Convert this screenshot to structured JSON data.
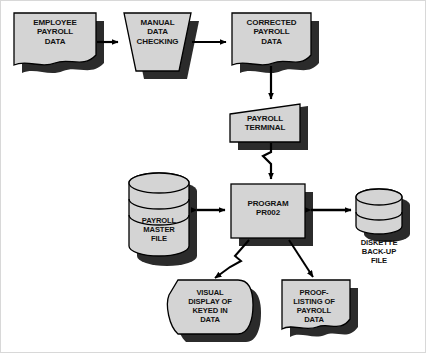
{
  "diagram": {
    "style": {
      "fill": "#d4d4d4",
      "shadow": "#2b2b2b",
      "stroke": "#000000",
      "background": "#ffffff",
      "frame": "#d8d8d8"
    },
    "nodes": [
      {
        "id": "employee-payroll-data",
        "name": "employee-payroll-data",
        "shape": "document",
        "label": "EMPLOYEE\nPAYROLL\nDATA",
        "x": 13,
        "y": 12,
        "w": 82,
        "h": 58
      },
      {
        "id": "manual-data-checking",
        "name": "manual-data-checking",
        "shape": "manual-operation-trapezoid",
        "label": "MANUAL\nDATA\nCHECKING",
        "x": 123,
        "y": 12,
        "w": 67,
        "h": 58
      },
      {
        "id": "corrected-payroll-data",
        "name": "corrected-payroll-data",
        "shape": "document",
        "label": "CORRECTED\nPAYROLL\nDATA",
        "x": 231,
        "y": 12,
        "w": 79,
        "h": 58
      },
      {
        "id": "payroll-terminal",
        "name": "payroll-terminal",
        "shape": "manual-input",
        "label": "PAYROLL\nTERMINAL",
        "x": 229,
        "y": 103,
        "w": 70,
        "h": 38
      },
      {
        "id": "program-pr002",
        "name": "program-pr002",
        "shape": "process-rectangle",
        "label": "PROGRAM\nPR002",
        "x": 230,
        "y": 183,
        "w": 74,
        "h": 54
      },
      {
        "id": "payroll-master-file",
        "name": "payroll-master-file",
        "shape": "disk-cylinder",
        "label": "PAYROLL\nMASTER\nFILE",
        "x": 128,
        "y": 172,
        "w": 60,
        "h": 83
      },
      {
        "id": "diskette-back-up-file",
        "name": "diskette-back-up-file",
        "shape": "disk-cylinder",
        "label": "DISKETTE\nBACK-UP\nFILE",
        "x": 355,
        "y": 188,
        "w": 46,
        "h": 45,
        "label_position": "below"
      },
      {
        "id": "visual-display-of-keyed-in-data",
        "name": "visual-display-of-keyed-in-data",
        "shape": "display",
        "label": "VISUAL\nDISPLAY OF\nKEYED IN\nDATA",
        "x": 177,
        "y": 279,
        "w": 68,
        "h": 54
      },
      {
        "id": "proof-listing-of-payroll-data",
        "name": "proof-listing-of-payroll-data",
        "shape": "document",
        "label": "PROOF-\nLISTING OF\nPAYROLL\nDATA",
        "x": 281,
        "y": 279,
        "w": 68,
        "h": 54
      }
    ],
    "connectors": [
      {
        "name": "employee-to-manual",
        "from": "employee-payroll-data",
        "to": "manual-data-checking",
        "type": "arrow",
        "direction": "right"
      },
      {
        "name": "manual-to-corrected",
        "from": "manual-data-checking",
        "to": "corrected-payroll-data",
        "type": "arrow",
        "direction": "right"
      },
      {
        "name": "corrected-to-terminal",
        "from": "corrected-payroll-data",
        "to": "payroll-terminal",
        "type": "arrow",
        "direction": "down"
      },
      {
        "name": "terminal-to-program",
        "from": "payroll-terminal",
        "to": "program-pr002",
        "type": "communication-link-arrow",
        "direction": "down"
      },
      {
        "name": "program-to-master-file",
        "from": "program-pr002",
        "to": "payroll-master-file",
        "type": "double-arrow",
        "direction": "horizontal"
      },
      {
        "name": "program-to-diskette",
        "from": "program-pr002",
        "to": "diskette-back-up-file",
        "type": "double-arrow",
        "direction": "horizontal"
      },
      {
        "name": "program-to-visual-display",
        "from": "program-pr002",
        "to": "visual-display-of-keyed-in-data",
        "type": "communication-link-arrow",
        "direction": "diagonal-down-left"
      },
      {
        "name": "program-to-proof-listing",
        "from": "program-pr002",
        "to": "proof-listing-of-payroll-data",
        "type": "arrow",
        "direction": "diagonal-down-right"
      }
    ]
  }
}
